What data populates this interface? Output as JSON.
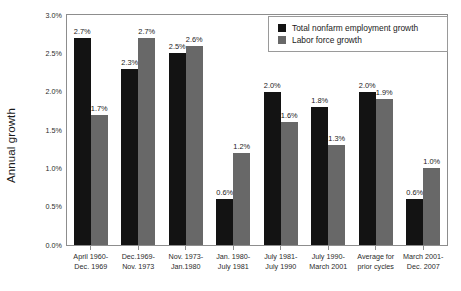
{
  "chart_data": {
    "type": "bar",
    "title": "",
    "xlabel": "",
    "ylabel": "Annual growth",
    "ylim": [
      0,
      3.0
    ],
    "ytick_labels": [
      "0.0%",
      "0.5%",
      "1.0%",
      "1.5%",
      "2.0%",
      "2.5%",
      "3.0%"
    ],
    "ytick_values": [
      0.0,
      0.5,
      1.0,
      1.5,
      2.0,
      2.5,
      3.0
    ],
    "grid": false,
    "legend_position": "top-right",
    "categories": [
      "April 1960-Dec. 1969",
      "Dec.1969-Nov. 1973",
      "Nov. 1973-Jan.1980",
      "Jan. 1980-July 1981",
      "July 1981-July 1990",
      "July 1990-March 2001",
      "Average for prior cycles",
      "March 2001-Dec. 2007"
    ],
    "category_lines": [
      [
        "April 1960-",
        "Dec. 1969"
      ],
      [
        "Dec.1969-",
        "Nov. 1973"
      ],
      [
        "Nov. 1973-",
        "Jan.1980"
      ],
      [
        "Jan. 1980-",
        "July 1981"
      ],
      [
        "July 1981-",
        "July 1990"
      ],
      [
        "July 1990-",
        "March 2001"
      ],
      [
        "Average for",
        "prior cycles"
      ],
      [
        "March 2001-",
        "Dec. 2007"
      ]
    ],
    "series": [
      {
        "name": "Total nonfarm employment growth",
        "color": "#131313",
        "values": [
          2.7,
          2.3,
          2.5,
          0.6,
          2.0,
          1.8,
          2.0,
          0.6
        ],
        "labels": [
          "2.7%",
          "2.3%",
          "2.5%",
          "0.6%",
          "2.0%",
          "1.8%",
          "2.0%",
          "0.6%"
        ]
      },
      {
        "name": "Labor force growth",
        "color": "#686868",
        "values": [
          1.7,
          2.7,
          2.6,
          1.2,
          1.6,
          1.3,
          1.9,
          1.0
        ],
        "labels": [
          "1.7%",
          "2.7%",
          "2.6%",
          "1.2%",
          "1.6%",
          "1.3%",
          "1.9%",
          "1.0%"
        ]
      }
    ]
  },
  "legend": {
    "items": [
      {
        "label": "Total nonfarm employment growth",
        "color": "#131313"
      },
      {
        "label": "Labor force growth",
        "color": "#686868"
      }
    ]
  },
  "colors": {
    "series_black": "#131313",
    "series_gray": "#686868",
    "axis": "#8d8d8d",
    "text": "#1b1b1b",
    "background": "#ffffff"
  }
}
